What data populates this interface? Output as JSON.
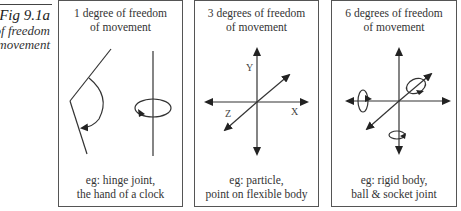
{
  "figure": {
    "number": "Fig 9.1a",
    "caption_line1": "of freedom",
    "caption_line2": "movement"
  },
  "panels": [
    {
      "title_line1": "1 degree of freedom",
      "title_line2": "of movement",
      "example_line1": "eg:  hinge joint,",
      "example_line2": "the hand of a clock",
      "diagram": "hinge-rotation"
    },
    {
      "title_line1": "3 degrees of freedom",
      "title_line2": "of movement",
      "example_line1": "eg:  particle,",
      "example_line2": "point on flexible body",
      "diagram": "xyz-axes",
      "axis_labels": {
        "x": "X",
        "y": "Y",
        "z": "Z"
      }
    },
    {
      "title_line1": "6 degrees of freedom",
      "title_line2": "of movement",
      "example_line1": "eg:  rigid body,",
      "example_line2": "ball & socket joint",
      "diagram": "xyz-axes-with-rotations"
    }
  ],
  "colors": {
    "line": "#333333",
    "border": "#555555",
    "text": "#333333"
  }
}
